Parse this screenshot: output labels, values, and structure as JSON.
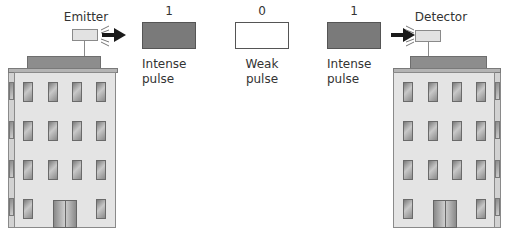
{
  "emitter": {
    "label": "Emitter"
  },
  "detector": {
    "label": "Detector"
  },
  "pulses": [
    {
      "bit": "1",
      "line1": "Intense",
      "line2": "pulse",
      "fill": "#7a7a7a"
    },
    {
      "bit": "0",
      "line1": "Weak",
      "line2": "pulse",
      "fill": "#ffffff"
    },
    {
      "bit": "1",
      "line1": "Intense",
      "line2": "pulse",
      "fill": "#7a7a7a"
    }
  ],
  "colors": {
    "intense_fill": "#7a7a7a",
    "weak_fill": "#ffffff",
    "building": "#e4e4e4",
    "roof": "#8d8d8d",
    "arrow": "#1a1a1a"
  }
}
